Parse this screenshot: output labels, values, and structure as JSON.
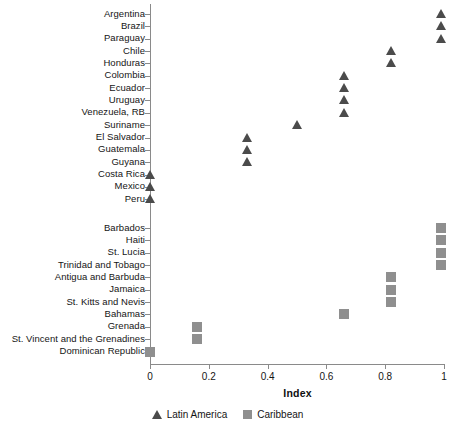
{
  "chart_data": {
    "type": "scatter",
    "title": "",
    "xlabel": "Index",
    "ylabel": "",
    "xlim": [
      0,
      1.05
    ],
    "xticks": [
      0,
      0.2,
      0.4,
      0.6,
      0.8,
      1
    ],
    "xtick_labels": [
      "0",
      "0.2",
      "0.4",
      "0.6",
      "0.8",
      "1"
    ],
    "grid": false,
    "legend_position": "bottom-center",
    "categories": [
      "Argentina",
      "Brazil",
      "Paraguay",
      "Chile",
      "Honduras",
      "Colombia",
      "Ecuador",
      "Uruguay",
      "Venezuela, RB",
      "Suriname",
      "El Salvador",
      "Guatemala",
      "Guyana",
      "Costa Rica",
      "Mexico",
      "Peru",
      "Barbados",
      "Haiti",
      "St. Lucia",
      "Trinidad and Tobago",
      "Antigua and Barbuda",
      "Jamaica",
      "St. Kitts and Nevis",
      "Bahamas",
      "Grenada",
      "St. Vincent and the Grenadines",
      "Dominican Republic"
    ],
    "series": [
      {
        "name": "Latin America",
        "marker": "triangle",
        "color": "#4b4b4b",
        "points": [
          {
            "label": "Argentina",
            "value": 0.99
          },
          {
            "label": "Brazil",
            "value": 0.99
          },
          {
            "label": "Paraguay",
            "value": 0.99
          },
          {
            "label": "Chile",
            "value": 0.82
          },
          {
            "label": "Honduras",
            "value": 0.82
          },
          {
            "label": "Colombia",
            "value": 0.66
          },
          {
            "label": "Ecuador",
            "value": 0.66
          },
          {
            "label": "Uruguay",
            "value": 0.66
          },
          {
            "label": "Venezuela, RB",
            "value": 0.66
          },
          {
            "label": "Suriname",
            "value": 0.5
          },
          {
            "label": "El Salvador",
            "value": 0.33
          },
          {
            "label": "Guatemala",
            "value": 0.33
          },
          {
            "label": "Guyana",
            "value": 0.33
          },
          {
            "label": "Costa Rica",
            "value": 0.0
          },
          {
            "label": "Mexico",
            "value": 0.0
          },
          {
            "label": "Peru",
            "value": 0.0
          }
        ]
      },
      {
        "name": "Caribbean",
        "marker": "square",
        "color": "#8f8f8f",
        "points": [
          {
            "label": "Barbados",
            "value": 0.99
          },
          {
            "label": "Haiti",
            "value": 0.99
          },
          {
            "label": "St. Lucia",
            "value": 0.99
          },
          {
            "label": "Trinidad and Tobago",
            "value": 0.99
          },
          {
            "label": "Antigua and Barbuda",
            "value": 0.82
          },
          {
            "label": "Jamaica",
            "value": 0.82
          },
          {
            "label": "St. Kitts and Nevis",
            "value": 0.82
          },
          {
            "label": "Bahamas",
            "value": 0.66
          },
          {
            "label": "Grenada",
            "value": 0.16
          },
          {
            "label": "St. Vincent and the Grenadines",
            "value": 0.16
          },
          {
            "label": "Dominican Republic",
            "value": 0.0
          }
        ]
      }
    ]
  },
  "axis": {
    "x_title": "Index"
  },
  "legend": {
    "entries": [
      {
        "label": "Latin America",
        "marker": "triangle"
      },
      {
        "label": "Caribbean",
        "marker": "square"
      }
    ]
  },
  "colors": {
    "latin_america": "#4b4b4b",
    "caribbean": "#8f8f8f",
    "axis": "#8a8a8a",
    "text": "#151515"
  }
}
